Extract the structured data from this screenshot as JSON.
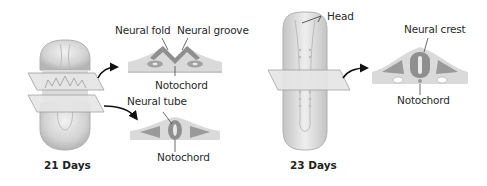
{
  "figure": {
    "panels": [
      {
        "caption": "21 Days",
        "sections": [
          {
            "labels": {
              "neural_fold": "Neural fold",
              "neural_groove": "Neural groove",
              "notochord": "Notochord"
            }
          },
          {
            "labels": {
              "neural_tube": "Neural tube",
              "notochord": "Notochord"
            }
          }
        ]
      },
      {
        "caption": "23 Days",
        "embryo_label": "Head",
        "sections": [
          {
            "labels": {
              "neural_crest": "Neural crest",
              "notochord": "Notochord"
            }
          }
        ]
      }
    ],
    "colors": {
      "embryo_fill": "#d9d9d9",
      "tissue_dark": "#9a9a9a",
      "tissue_light": "#d6d6d6",
      "plane_fill": "#e4e4e4",
      "arrow": "#111111"
    }
  }
}
